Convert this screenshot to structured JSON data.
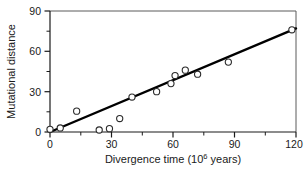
{
  "chart_data": {
    "type": "scatter",
    "title": "",
    "xlabel": "Divergence time (10⁶ years)",
    "xlabel_base": "Divergence time (10",
    "xlabel_exponent": "6",
    "xlabel_tail": " years)",
    "ylabel": "Mutational distance",
    "xlim": [
      0,
      120
    ],
    "ylim": [
      0,
      90
    ],
    "xticks": [
      0,
      30,
      60,
      90,
      120
    ],
    "xtick_labels": [
      "0",
      "30",
      "60",
      "90",
      "120"
    ],
    "yticks": [
      0,
      30,
      60,
      90
    ],
    "ytick_labels": [
      "0",
      "30",
      "60",
      "90"
    ],
    "x_minor_ticks": [
      15,
      45,
      75,
      105
    ],
    "y_minor_ticks": [
      15,
      45,
      75
    ],
    "grid": false,
    "legend": null,
    "marker": "open-circle",
    "points": [
      {
        "x": 0,
        "y": 2.0
      },
      {
        "x": 5,
        "y": 3.0
      },
      {
        "x": 13,
        "y": 15.5
      },
      {
        "x": 24,
        "y": 1.5
      },
      {
        "x": 29,
        "y": 2.5
      },
      {
        "x": 34,
        "y": 10.0
      },
      {
        "x": 40,
        "y": 26.0
      },
      {
        "x": 52,
        "y": 30.0
      },
      {
        "x": 59,
        "y": 36.0
      },
      {
        "x": 61,
        "y": 42.0
      },
      {
        "x": 66,
        "y": 46.0
      },
      {
        "x": 72,
        "y": 43.0
      },
      {
        "x": 87,
        "y": 52.0
      },
      {
        "x": 118,
        "y": 76.0
      }
    ],
    "fit_line": {
      "type": "linear-regression",
      "x_start": 0,
      "y_start": 0,
      "x_end": 120,
      "y_end": 77,
      "slope": 0.642,
      "intercept": 0
    },
    "colors": {
      "marker_stroke": "#2b2b2b",
      "marker_fill": "#ffffff",
      "fit_line": "#000000",
      "axis": "#1a1a1a",
      "frame": "#5a5a5a",
      "background": "#ffffff"
    }
  }
}
